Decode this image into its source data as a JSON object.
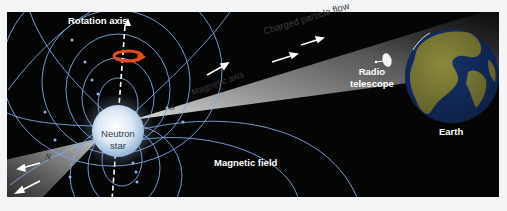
{
  "labels": {
    "rotation_axis": "Rotation axis",
    "charged_particle_flow": "Charged particle flow",
    "magnetic_axis": "Magnetic axis",
    "south_pole": "S",
    "north_pole": "N",
    "neutron_star_line1": "Neutron",
    "neutron_star_line2": "star",
    "radio_telescope_line1": "Radio",
    "radio_telescope_line2": "telescope",
    "earth": "Earth",
    "magnetic_field": "Magnetic field"
  },
  "icons": {
    "rotation_arrow": "curved-rotation-arrow-icon",
    "radio_dish": "satellite-dish-icon"
  },
  "colors": {
    "page_background": "#f4f5f6",
    "space_background": "#050506",
    "field_lines": "#7fa6e0",
    "beam": "#cfcfcf",
    "star_core": "#eef4fb",
    "star_edge": "#9cb8d6",
    "rotation_arrow": "#e84a1c",
    "earth_ocean": "#15336e",
    "earth_land": "#8c8a3c",
    "text_light": "#ffffff",
    "text_dark": "#333333"
  },
  "geometry": {
    "panel": {
      "x": 7,
      "y": 12,
      "width": 492,
      "height": 185
    },
    "neutron_star": {
      "cx": 118,
      "cy": 131,
      "r": 26
    },
    "earth": {
      "cx": 452,
      "cy": 76,
      "r": 47
    }
  }
}
